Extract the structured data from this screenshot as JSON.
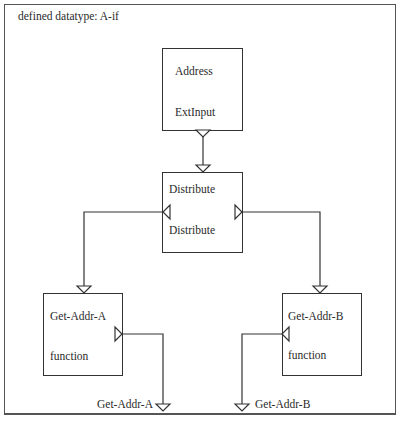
{
  "caption": "Figure 10.?  Defined datatype",
  "frame": {
    "title": "defined datatype: A-if"
  },
  "nodes": [
    {
      "id": "address",
      "name": "Address",
      "port_label": "ExtInput"
    },
    {
      "id": "distribute",
      "name": "Distribute",
      "port_label": "Distribute"
    },
    {
      "id": "get-addr-a",
      "name": "Get-Addr-A",
      "port_label": "function"
    },
    {
      "id": "get-addr-b",
      "name": "Get-Addr-B",
      "port_label": "function"
    }
  ],
  "outputs": [
    {
      "id": "out-a",
      "label": "Get-Addr-A"
    },
    {
      "id": "out-b",
      "label": "Get-Addr-B"
    }
  ],
  "edges": [
    {
      "from": "Address.ExtInput",
      "to": "Distribute"
    },
    {
      "from": "Distribute.left",
      "to": "Get-Addr-A"
    },
    {
      "from": "Distribute.right",
      "to": "Get-Addr-B"
    },
    {
      "from": "Get-Addr-A.function",
      "to": "Get-Addr-A (output)"
    },
    {
      "from": "Get-Addr-B.function",
      "to": "Get-Addr-B (output)"
    }
  ]
}
